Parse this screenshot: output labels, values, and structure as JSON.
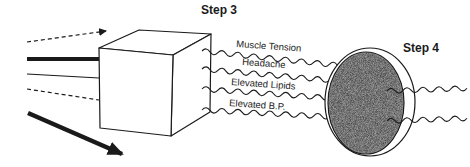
{
  "diagram": {
    "step3_label": "Step 3",
    "step4_label": "Step 4",
    "wave_labels": [
      "Muscle Tension",
      "Headache",
      "Elevated Lipids",
      "Elevated B.P."
    ],
    "colors": {
      "stroke": "#1a1a1a",
      "sphere_fill": "#a8a8a8",
      "background": "#ffffff"
    }
  }
}
